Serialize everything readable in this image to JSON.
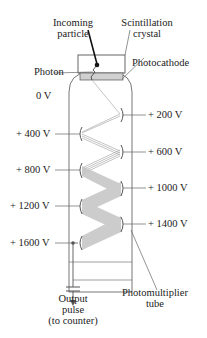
{
  "labels": {
    "incoming_particle": [
      "Incoming",
      "particle"
    ],
    "scintillation_crystal": [
      "Scintillation",
      "crystal"
    ],
    "photocathode": "Photocathode",
    "photon": "Photon",
    "zero_volt": "0 V",
    "dynodes_right": [
      "+ 200 V",
      "+ 600 V",
      "+ 1000 V",
      "+ 1400 V"
    ],
    "dynodes_left": [
      "+ 400 V",
      "+ 800 V",
      "+ 1200 V",
      "+ 1600 V"
    ],
    "output": [
      "Output",
      "pulse",
      "(to counter)"
    ],
    "tube": [
      "Photomultiplier",
      "tube"
    ]
  },
  "colors": {
    "line": "#555555",
    "beam": "#bdbdbd",
    "photocathode": "#d0d0d0",
    "particle": "#111111"
  }
}
